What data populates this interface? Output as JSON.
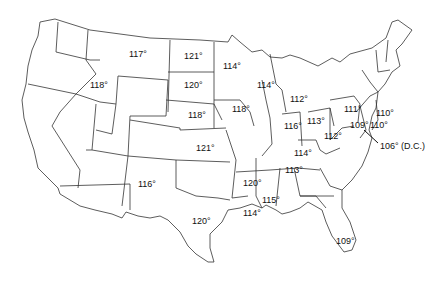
{
  "map": {
    "title": "",
    "unit": "°",
    "labels": [
      {
        "state": "Montana",
        "text": "117°",
        "x": 129,
        "y": 53
      },
      {
        "state": "North Dakota",
        "text": "121°",
        "x": 184,
        "y": 55
      },
      {
        "state": "Minnesota",
        "text": "114°",
        "x": 223,
        "y": 65
      },
      {
        "state": "Idaho",
        "text": "118°",
        "x": 90,
        "y": 84
      },
      {
        "state": "South Dakota",
        "text": "120°",
        "x": 184,
        "y": 84
      },
      {
        "state": "Wisconsin",
        "text": "114°",
        "x": 257,
        "y": 84
      },
      {
        "state": "Nebraska",
        "text": "118°",
        "x": 188,
        "y": 114
      },
      {
        "state": "Iowa",
        "text": "118°",
        "x": 232,
        "y": 108
      },
      {
        "state": "Michigan",
        "text": "112°",
        "x": 290,
        "y": 98
      },
      {
        "state": "Pennsylvania",
        "text": "111°",
        "x": 344,
        "y": 108
      },
      {
        "state": "New Jersey",
        "text": "110°",
        "x": 376,
        "y": 112
      },
      {
        "state": "Illinois",
        "text": "116°",
        "x": 284,
        "y": 125
      },
      {
        "state": "Indiana/Ohio",
        "text": "113°",
        "x": 307,
        "y": 120
      },
      {
        "state": "Maryland",
        "text": "109°",
        "x": 350,
        "y": 124
      },
      {
        "state": "Delaware",
        "text": "110°",
        "x": 370,
        "y": 124
      },
      {
        "state": "West Virginia",
        "text": "112°",
        "x": 324,
        "y": 135
      },
      {
        "state": "District of Columbia",
        "text": "106° (D.C.)",
        "x": 380,
        "y": 145
      },
      {
        "state": "Kansas",
        "text": "121°",
        "x": 196,
        "y": 147
      },
      {
        "state": "Kentucky",
        "text": "114°",
        "x": 294,
        "y": 152
      },
      {
        "state": "Tennessee",
        "text": "113°",
        "x": 285,
        "y": 169
      },
      {
        "state": "New Mexico",
        "text": "116°",
        "x": 138,
        "y": 183
      },
      {
        "state": "Arkansas",
        "text": "120°",
        "x": 243,
        "y": 182
      },
      {
        "state": "Mississippi",
        "text": "115°",
        "x": 262,
        "y": 199
      },
      {
        "state": "Texas",
        "text": "120°",
        "x": 192,
        "y": 220
      },
      {
        "state": "Louisiana",
        "text": "114°",
        "x": 243,
        "y": 212
      },
      {
        "state": "Florida",
        "text": "109°",
        "x": 336,
        "y": 240
      }
    ]
  }
}
